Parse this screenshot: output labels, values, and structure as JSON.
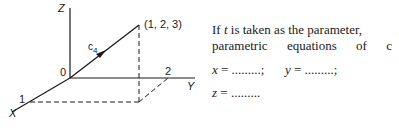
{
  "figure": {
    "axis_labels": {
      "z": "Z",
      "y": "Y",
      "x": "X"
    },
    "origin_label": "0",
    "point_label": "(1, 2, 3)",
    "curve_label": "c",
    "curve_subscript": "4",
    "x_tick": "1",
    "y_tick": "2"
  },
  "text": {
    "line1_pre": "If ",
    "line1_var": "t",
    "line1_post": " is taken as the parameter,",
    "line2_words": [
      "parametric",
      "equations",
      "of",
      "c"
    ],
    "eq_x_var": "x",
    "eq_x_rest": " = .........;",
    "eq_y_var": "y",
    "eq_y_rest": " = .........;",
    "eq_z_var": "z",
    "eq_z_rest": " = ........."
  }
}
